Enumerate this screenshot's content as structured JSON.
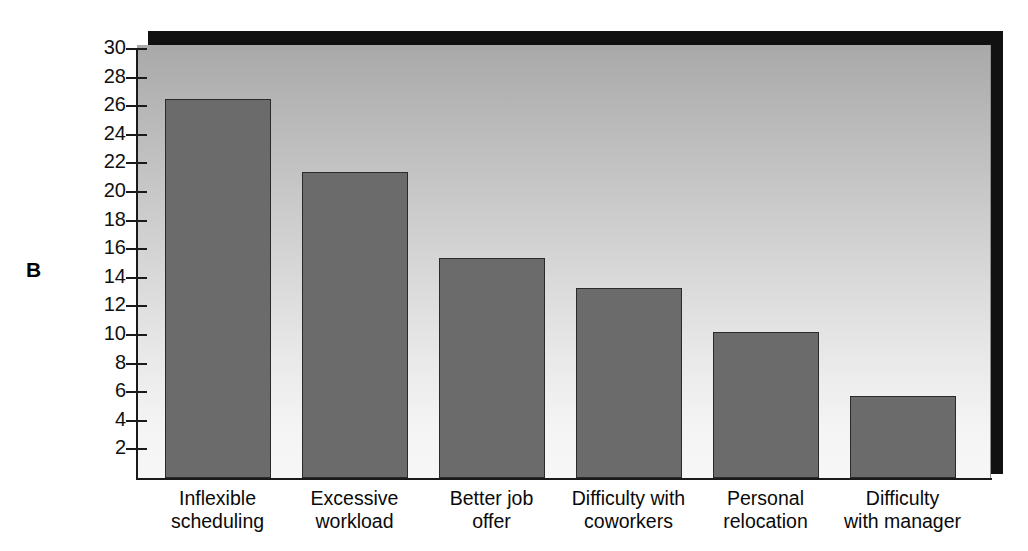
{
  "figure": {
    "panel_letter": "B"
  },
  "chart_data": {
    "type": "bar",
    "title": "",
    "subtitle": "",
    "xlabel": "",
    "ylabel": "",
    "categories": [
      "Inflexible\nscheduling",
      "Excessive\nworkload",
      "Better job\noffer",
      "Difficulty with\ncoworkers",
      "Personal\nrelocation",
      "Difficulty\nwith manager"
    ],
    "values": [
      26.5,
      21.4,
      15.4,
      13.3,
      10.2,
      5.7
    ],
    "ylim": [
      0,
      30
    ],
    "ytick_labels": [
      "30",
      "28",
      "26",
      "24",
      "22",
      "20",
      "18",
      "16",
      "14",
      "12",
      "10",
      "8",
      "6",
      "4",
      "2"
    ],
    "ytick_values": [
      30,
      28,
      26,
      24,
      22,
      20,
      18,
      16,
      14,
      12,
      10,
      8,
      6,
      4,
      2
    ],
    "grid": false,
    "legend": null,
    "series_color": "#6b6b6b",
    "bar_edge_color": "#2a2a2a",
    "plot_background": "gradient-gray"
  }
}
